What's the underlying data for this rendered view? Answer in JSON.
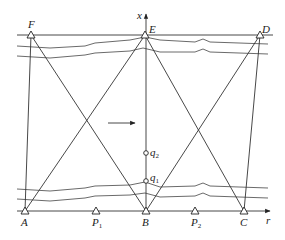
{
  "diagram": {
    "type": "survey-triangulation-network",
    "axes": {
      "vertical_label": "x",
      "horizontal_label": "r"
    },
    "top_stations": [
      {
        "label": "F",
        "x": 31,
        "y": 35
      },
      {
        "label": "E",
        "x": 145,
        "y": 35
      },
      {
        "label": "D",
        "x": 260,
        "y": 35
      }
    ],
    "bottom_stations": [
      {
        "label": "A",
        "x": 25,
        "y": 211
      },
      {
        "label": "B",
        "x": 146,
        "y": 211
      },
      {
        "label": "C",
        "x": 244,
        "y": 211
      }
    ],
    "intermediate_points": [
      {
        "label": "P",
        "sub": "1",
        "x": 96,
        "y": 211
      },
      {
        "label": "P",
        "sub": "2",
        "x": 195,
        "y": 211
      }
    ],
    "centerline_points": [
      {
        "label": "q",
        "sub": "2",
        "x": 146,
        "y": 153
      },
      {
        "label": "q",
        "sub": "1",
        "x": 146,
        "y": 181
      }
    ],
    "flow_arrow": {
      "from_x": 108,
      "to_x": 135,
      "y": 123
    }
  }
}
